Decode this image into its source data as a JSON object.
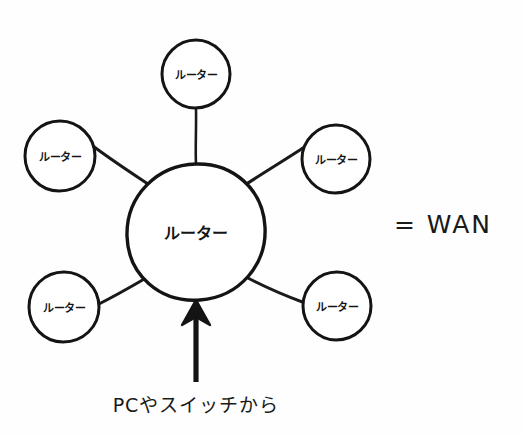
{
  "diagram": {
    "ink_color": "#1a1a1a",
    "background_color": "#fefefe",
    "hub": {
      "label": "ルーター",
      "cx": 196,
      "cy": 232,
      "r": 68
    },
    "satellites": [
      {
        "id": "top",
        "label": "ルーター",
        "cx": 196,
        "cy": 74,
        "r": 34
      },
      {
        "id": "upper-left",
        "label": "ルーター",
        "cx": 60,
        "cy": 156,
        "r": 35
      },
      {
        "id": "upper-right",
        "label": "ルーター",
        "cx": 336,
        "cy": 159,
        "r": 34
      },
      {
        "id": "lower-left",
        "label": "ルーター",
        "cx": 64,
        "cy": 307,
        "r": 35
      },
      {
        "id": "lower-right",
        "label": "ルーター",
        "cx": 337,
        "cy": 306,
        "r": 34
      }
    ],
    "arrow": {
      "label": "incoming-traffic-arrow",
      "from_x": 196,
      "from_y": 382,
      "to_x": 196,
      "to_y": 301
    },
    "annotations": {
      "wan": {
        "text": "= WAN",
        "x": 443,
        "y": 224
      },
      "caption": {
        "text": "PCやスイッチから",
        "x": 196,
        "y": 403
      }
    }
  }
}
